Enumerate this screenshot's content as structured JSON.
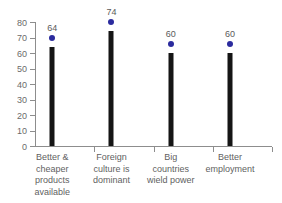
{
  "chart_data": {
    "type": "bar",
    "title": "",
    "subtitle": "",
    "xlabel": "",
    "ylabel": "",
    "ylim": [
      0,
      80
    ],
    "yticks": [
      0,
      10,
      20,
      30,
      40,
      50,
      60,
      70,
      80
    ],
    "grid": false,
    "legend": null,
    "categories": [
      "Better & cheaper products available",
      "Foreign culture is dominant",
      "Big countries wield power",
      "Better employment"
    ],
    "category_lines": [
      [
        "Better &",
        "cheaper",
        "products",
        "available"
      ],
      [
        "Foreign",
        "culture is",
        "dominant"
      ],
      [
        "Big",
        "countries",
        "wield power"
      ],
      [
        "Better",
        "employment"
      ]
    ],
    "values": [
      64,
      74,
      60,
      60
    ],
    "value_labels": [
      "64",
      "74",
      "60",
      "60"
    ],
    "marker": "dot",
    "colors": {
      "bar": "#151515",
      "marker": "#2b2b9e",
      "axis": "#8d8d8d",
      "text": "#5f5f5f",
      "background": "#ffffff"
    }
  }
}
